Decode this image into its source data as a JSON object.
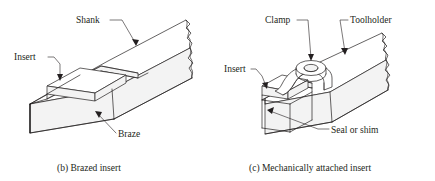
{
  "figure": {
    "background_color": "#ffffff",
    "line_color": "#231f20"
  },
  "panels": [
    {
      "id": "b",
      "caption": "(b) Brazed insert",
      "labels": [
        {
          "name": "shank",
          "text": "Shank"
        },
        {
          "name": "insert",
          "text": "Insert"
        },
        {
          "name": "braze",
          "text": "Braze"
        }
      ]
    },
    {
      "id": "c",
      "caption": "(c) Mechanically attached insert",
      "labels": [
        {
          "name": "clamp",
          "text": "Clamp"
        },
        {
          "name": "toolholder",
          "text": "Toolholder"
        },
        {
          "name": "insert",
          "text": "Insert"
        },
        {
          "name": "seal-or-shim",
          "text": "Seal or shim"
        }
      ]
    }
  ]
}
